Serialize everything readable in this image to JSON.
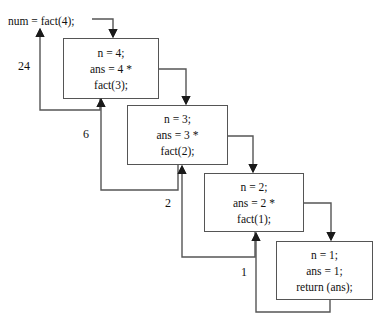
{
  "diagram": {
    "caller": {
      "text": "num = fact(4);"
    },
    "frames": [
      {
        "id": "frame-fact-4",
        "lines": [
          "n = 4;",
          "ans = 4 *",
          "fact(3);"
        ],
        "x": 63,
        "y": 38,
        "w": 96,
        "h": 61
      },
      {
        "id": "frame-fact-3",
        "lines": [
          "n = 3;",
          "ans = 3 *",
          "fact(2);"
        ],
        "x": 127,
        "y": 105,
        "w": 101,
        "h": 60
      },
      {
        "id": "frame-fact-2",
        "lines": [
          "n = 2;",
          "ans = 2 *",
          "fact(1);"
        ],
        "x": 204,
        "y": 173,
        "w": 100,
        "h": 59
      },
      {
        "id": "frame-fact-1",
        "lines": [
          "n = 1;",
          "ans = 1;",
          "return (ans);"
        ],
        "x": 276,
        "y": 241,
        "w": 97,
        "h": 59
      }
    ],
    "return_labels": [
      {
        "id": "return-value-24",
        "value": "24",
        "x": 18,
        "y": 59
      },
      {
        "id": "return-value-6",
        "value": "6",
        "x": 83,
        "y": 127
      },
      {
        "id": "return-value-2",
        "value": "2",
        "x": 165,
        "y": 196
      },
      {
        "id": "return-value-1",
        "value": "1",
        "x": 241,
        "y": 265
      }
    ],
    "colors": {
      "box_border": "#555555",
      "wire": "#555555",
      "arrow_head": "#1a1a1a",
      "text": "#111111",
      "background": "#ffffff"
    }
  }
}
